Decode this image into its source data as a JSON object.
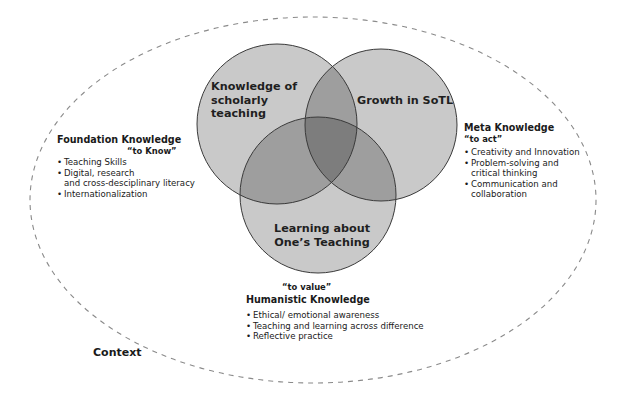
{
  "diagram": {
    "colors": {
      "background": "#ffffff",
      "circle_fill": "#c9c9c9",
      "overlap2_fill": "#9e9e9e",
      "overlap3_fill": "#7d7d7d",
      "circle_stroke": "#3a3a3a",
      "ellipse_stroke": "#8a8a8a",
      "text": "#1a1a1a"
    },
    "context_ellipse": {
      "cx": 313,
      "cy": 200,
      "rx": 283,
      "ry": 183,
      "label": "Context"
    },
    "circles": [
      {
        "id": "scholarly",
        "cx": 277,
        "cy": 124,
        "r": 80,
        "label_lines": [
          "Knowledge of",
          "scholarly",
          "teaching"
        ]
      },
      {
        "id": "sotl",
        "cx": 381,
        "cy": 125,
        "r": 76,
        "label_lines": [
          "Growth in SoTL"
        ]
      },
      {
        "id": "learning",
        "cx": 318,
        "cy": 195,
        "r": 78,
        "label_lines": [
          "Learning about",
          "One’s Teaching"
        ]
      }
    ],
    "foundation": {
      "title": "Foundation Knowledge",
      "quote": "“to Know”",
      "items": [
        "Teaching Skills",
        "Digital, research\nand cross-desciplinary literacy",
        "Internationalization"
      ]
    },
    "meta": {
      "title": "Meta Knowledge",
      "quote": "“to act”",
      "items": [
        "Creativity and Innovation",
        "Problem-solving and\ncritical thinking",
        "Communication and\ncollaboration"
      ]
    },
    "humanistic": {
      "quote": "“to value”",
      "title": "Humanistic Knowledge",
      "items": [
        "Ethical/ emotional awareness",
        "Teaching and learning across difference",
        "Reflective practice"
      ]
    }
  }
}
